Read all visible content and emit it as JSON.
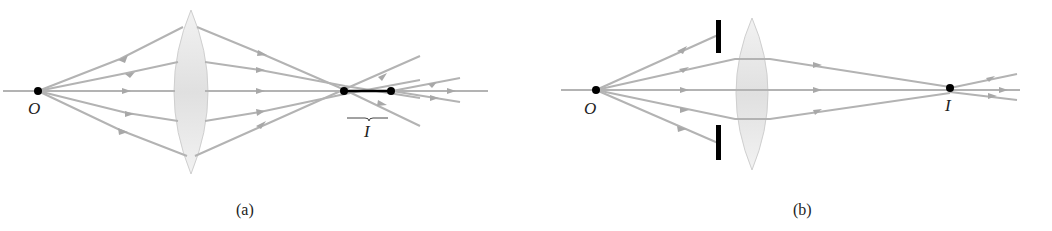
{
  "figure": {
    "panels": [
      {
        "id": "a",
        "caption": "(a)",
        "object_label": "O",
        "image_label": "I",
        "description": "Lens without aperture: rays converge to an extended image region I"
      },
      {
        "id": "b",
        "caption": "(b)",
        "object_label": "O",
        "image_label": "I",
        "description": "Aperture stops block outer rays; rays converge to a point image I"
      }
    ],
    "colors": {
      "ray": "#b3b3b3",
      "lens": "#e6e6e6",
      "point": "#000000",
      "stop": "#000000"
    }
  }
}
